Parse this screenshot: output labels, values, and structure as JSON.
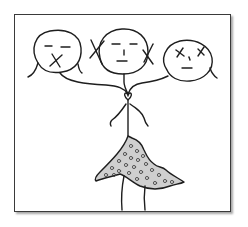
{
  "illustration": {
    "description": "Hand-drawn stick figure in a polka-dot skirt with three heads: left head with X over mouth, center head neutral with X marks over both ears, right head with X eyes",
    "heads": [
      {
        "position": "left",
        "expression": "mouth-crossed-out"
      },
      {
        "position": "center",
        "expression": "ears-crossed-out"
      },
      {
        "position": "right",
        "expression": "eyes-crossed-out"
      }
    ],
    "colors": {
      "ink": "#1e1e1e",
      "skirt_fill": "#bcbcbc",
      "background": "#ffffff",
      "frame": "#3a3a3a"
    }
  }
}
